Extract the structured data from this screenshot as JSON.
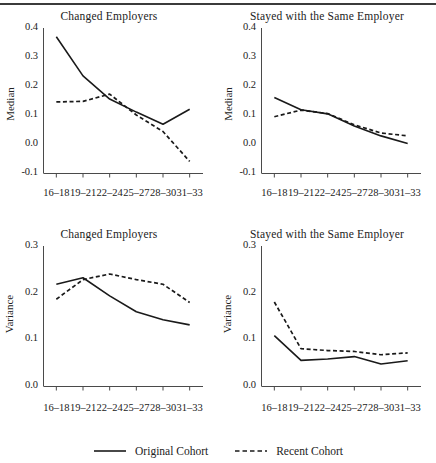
{
  "figure": {
    "has_top_rule": true,
    "width": 436,
    "height": 463
  },
  "legend": {
    "position": "bottom-center",
    "items": [
      {
        "label": "Original Cohort",
        "style": "solid",
        "color": "#1a1a1a"
      },
      {
        "label": "Recent Cohort",
        "style": "dashed",
        "color": "#1a1a1a"
      }
    ]
  },
  "chart_data": [
    {
      "id": "median-changed-employers",
      "type": "line",
      "title": "Changed Employers",
      "xlabel": "",
      "ylabel": "Median",
      "categories": [
        "16–18",
        "19–21",
        "22–24",
        "25–27",
        "28–30",
        "31–33"
      ],
      "ylim": [
        -0.1,
        0.4
      ],
      "yticks": [
        "0.4",
        "0.3",
        "0.2",
        "0.1",
        "0.0",
        "-0.1"
      ],
      "ytickvalues": [
        0.4,
        0.3,
        0.2,
        0.1,
        0.0,
        -0.1
      ],
      "grid": false,
      "series": [
        {
          "name": "Original Cohort",
          "style": "solid",
          "values": [
            0.37,
            0.235,
            0.155,
            0.11,
            0.068,
            0.12
          ]
        },
        {
          "name": "Recent Cohort",
          "style": "dashed",
          "values": [
            0.145,
            0.147,
            0.172,
            0.1,
            0.043,
            -0.06
          ]
        }
      ]
    },
    {
      "id": "median-stayed-same-employer",
      "type": "line",
      "title": "Stayed with the Same Employer",
      "xlabel": "",
      "ylabel": "Median",
      "categories": [
        "16–18",
        "19–21",
        "22–24",
        "25–27",
        "28–30",
        "31–33"
      ],
      "ylim": [
        -0.1,
        0.4
      ],
      "yticks": [
        "0.4",
        "0.3",
        "0.2",
        "0.1",
        "0.0",
        "-0.1"
      ],
      "ytickvalues": [
        0.4,
        0.3,
        0.2,
        0.1,
        0.0,
        -0.1
      ],
      "grid": false,
      "series": [
        {
          "name": "Original Cohort",
          "style": "solid",
          "values": [
            0.16,
            0.118,
            0.104,
            0.062,
            0.028,
            0.002
          ]
        },
        {
          "name": "Recent Cohort",
          "style": "dashed",
          "values": [
            0.094,
            0.117,
            0.105,
            0.066,
            0.038,
            0.028
          ]
        }
      ]
    },
    {
      "id": "variance-changed-employers",
      "type": "line",
      "title": "Changed Employers",
      "xlabel": "",
      "ylabel": "Variance",
      "categories": [
        "16–18",
        "19–21",
        "22–24",
        "25–27",
        "28–30",
        "31–33"
      ],
      "ylim": [
        0.0,
        0.3
      ],
      "yticks": [
        "0.3",
        "0.2",
        "0.1",
        "0.0"
      ],
      "ytickvalues": [
        0.3,
        0.2,
        0.1,
        0.0
      ],
      "grid": false,
      "series": [
        {
          "name": "Original Cohort",
          "style": "solid",
          "values": [
            0.218,
            0.232,
            0.193,
            0.159,
            0.142,
            0.131
          ]
        },
        {
          "name": "Recent Cohort",
          "style": "dashed",
          "values": [
            0.186,
            0.228,
            0.24,
            0.228,
            0.218,
            0.179
          ]
        }
      ]
    },
    {
      "id": "variance-stayed-same-employer",
      "type": "line",
      "title": "Stayed with the Same Employer",
      "xlabel": "",
      "ylabel": "Variance",
      "categories": [
        "16–18",
        "19–21",
        "22–24",
        "25–27",
        "28–30",
        "31–33"
      ],
      "ylim": [
        0.0,
        0.3
      ],
      "yticks": [
        "0.3",
        "0.2",
        "0.1",
        "0.0"
      ],
      "ytickvalues": [
        0.3,
        0.2,
        0.1,
        0.0
      ],
      "grid": false,
      "series": [
        {
          "name": "Original Cohort",
          "style": "solid",
          "values": [
            0.108,
            0.055,
            0.058,
            0.063,
            0.047,
            0.054
          ]
        },
        {
          "name": "Recent Cohort",
          "style": "dashed",
          "values": [
            0.18,
            0.08,
            0.076,
            0.074,
            0.067,
            0.071
          ]
        }
      ]
    }
  ]
}
